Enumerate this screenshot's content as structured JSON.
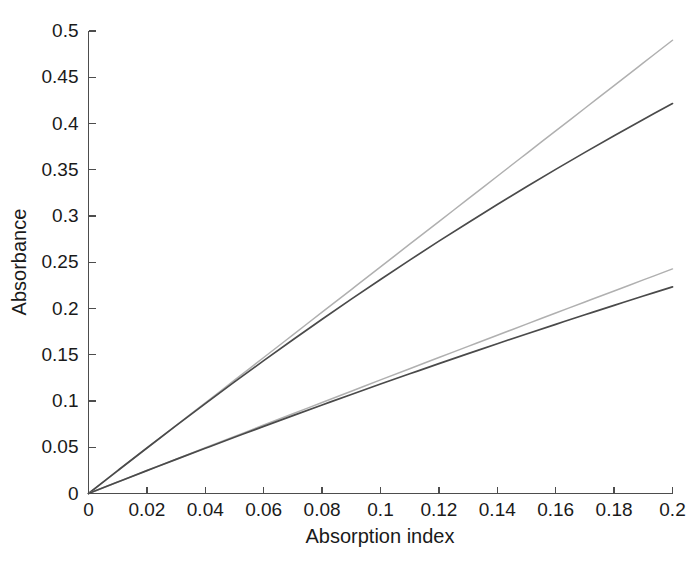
{
  "chart_data": {
    "type": "line",
    "title": "",
    "xlabel": "Absorption index",
    "ylabel": "Absorbance",
    "xlim": [
      0,
      0.2
    ],
    "ylim": [
      0,
      0.5
    ],
    "grid": false,
    "legend": "none",
    "xticks": [
      0,
      0.02,
      0.04,
      0.06,
      0.08,
      0.1,
      0.12,
      0.14,
      0.16,
      0.18,
      0.2
    ],
    "xticklabels": [
      "0",
      "0.02",
      "0.04",
      "0.06",
      "0.08",
      "0.1",
      "0.12",
      "0.14",
      "0.16",
      "0.18",
      "0.2"
    ],
    "yticks": [
      0,
      0.05,
      0.1,
      0.15,
      0.2,
      0.25,
      0.3,
      0.35,
      0.4,
      0.45,
      0.5
    ],
    "yticklabels": [
      "0",
      "0.05",
      "0.1",
      "0.15",
      "0.2",
      "0.25",
      "0.3",
      "0.35",
      "0.4",
      "0.45",
      "0.5"
    ],
    "x": [
      0,
      0.01,
      0.02,
      0.03,
      0.04,
      0.05,
      0.06,
      0.07,
      0.08,
      0.09,
      0.1,
      0.11,
      0.12,
      0.13,
      0.14,
      0.15,
      0.16,
      0.17,
      0.18,
      0.19,
      0.2
    ],
    "series": [
      {
        "name": "upper-light-linear",
        "color": "#b0b0b0",
        "width": 1.5,
        "values": [
          0,
          0.0245,
          0.049,
          0.0735,
          0.098,
          0.1225,
          0.147,
          0.1715,
          0.196,
          0.2205,
          0.245,
          0.2695,
          0.294,
          0.3185,
          0.343,
          0.3675,
          0.392,
          0.4165,
          0.441,
          0.4655,
          0.49
        ]
      },
      {
        "name": "upper-dark-saturating",
        "color": "#4a4a4a",
        "width": 1.7,
        "values": [
          0,
          0.0247,
          0.0492,
          0.0734,
          0.0972,
          0.1206,
          0.1436,
          0.1662,
          0.1884,
          0.2101,
          0.2314,
          0.2523,
          0.2728,
          0.2928,
          0.3124,
          0.3316,
          0.3504,
          0.3688,
          0.3868,
          0.4044,
          0.4216
        ]
      },
      {
        "name": "lower-light-near-linear",
        "color": "#b0b0b0",
        "width": 1.5,
        "values": [
          0,
          0.0124,
          0.0248,
          0.0371,
          0.0494,
          0.0617,
          0.074,
          0.0862,
          0.0984,
          0.1106,
          0.1228,
          0.1349,
          0.147,
          0.1591,
          0.1711,
          0.1831,
          0.1951,
          0.2071,
          0.219,
          0.2309,
          0.2428
        ]
      },
      {
        "name": "lower-dark-saturating",
        "color": "#4a4a4a",
        "width": 1.7,
        "values": [
          0,
          0.0124,
          0.0247,
          0.0369,
          0.0489,
          0.0608,
          0.0726,
          0.0842,
          0.0957,
          0.1071,
          0.1183,
          0.1294,
          0.1404,
          0.1512,
          0.1619,
          0.1725,
          0.1829,
          0.1932,
          0.2034,
          0.2135,
          0.2234
        ]
      }
    ]
  },
  "axes": {
    "x_title": "Absorption index",
    "y_title": "Absorbance"
  }
}
